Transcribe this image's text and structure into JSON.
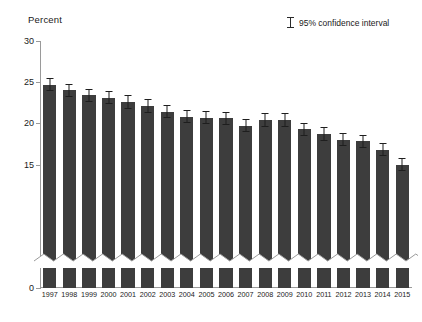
{
  "chart": {
    "ylabel": "Percent",
    "legend_label": "95% confidence interval",
    "legend_icon": "error-bar-icon"
  },
  "chart_data": {
    "type": "bar",
    "title": "",
    "xlabel": "",
    "ylabel": "Percent",
    "ylim": [
      0,
      30
    ],
    "yticks": [
      0,
      15,
      20,
      25,
      30
    ],
    "axis_break": true,
    "axis_break_note": "y-axis broken between 0 and 15 (zigzag across bars)",
    "grid": false,
    "legend": [
      "95% confidence interval"
    ],
    "legend_position": "top-right",
    "bar_color": "#3d3d3d",
    "categories": [
      "1997",
      "1998",
      "1999",
      "2000",
      "2001",
      "2002",
      "2003",
      "2004",
      "2005",
      "2006",
      "2007",
      "2008",
      "2009",
      "2010",
      "2011",
      "2012",
      "2013",
      "2014",
      "2015"
    ],
    "values": [
      24.7,
      24.0,
      23.4,
      23.1,
      22.6,
      22.1,
      21.4,
      20.8,
      20.7,
      20.6,
      19.7,
      20.4,
      20.4,
      19.3,
      18.7,
      18.0,
      17.8,
      16.8,
      15.0
    ],
    "errors_low": [
      23.9,
      23.2,
      22.6,
      22.3,
      21.8,
      21.3,
      20.6,
      20.0,
      19.9,
      19.8,
      18.9,
      19.5,
      19.5,
      18.5,
      17.9,
      17.2,
      17.0,
      16.0,
      14.2
    ],
    "errors_high": [
      25.5,
      24.8,
      24.2,
      23.9,
      23.4,
      22.9,
      22.2,
      21.6,
      21.5,
      21.4,
      20.5,
      21.3,
      21.3,
      20.1,
      19.5,
      18.8,
      18.6,
      17.6,
      15.8
    ]
  }
}
